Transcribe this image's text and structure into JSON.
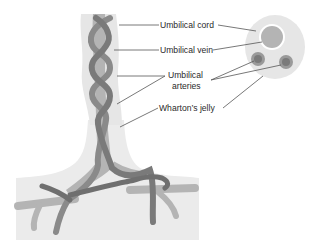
{
  "diagram": {
    "labels": {
      "cord": "Umbilical cord",
      "vein": "Umbilical vein",
      "arteries_line1": "Umbilical",
      "arteries_line2": "arteries",
      "jelly": "Wharton’s jelly"
    },
    "colors": {
      "jelly": "#e6e6e6",
      "placenta": "#ebebeb",
      "vein": "#b4b4b4",
      "artery": "#8a8a8a",
      "artery_dark": "#6f6f6f",
      "line": "#555555",
      "text": "#2a2a2a"
    }
  }
}
